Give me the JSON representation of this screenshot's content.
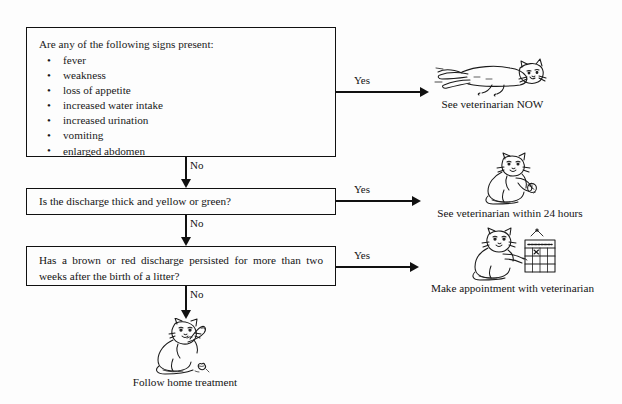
{
  "flowchart": {
    "title": "Vaginal discharge decision chart",
    "background": "#fdfdfd",
    "line_color": "#111111",
    "nodes": [
      {
        "id": "signs",
        "type": "decision",
        "prompt": "Are any of the following signs present:",
        "items": [
          "fever",
          "weakness",
          "loss of appetite",
          "increased water intake",
          "increased urination",
          "vomiting",
          "enlarged abdomen"
        ]
      },
      {
        "id": "discharge",
        "type": "decision",
        "text": "Is the discharge thick and yellow or green?"
      },
      {
        "id": "persist",
        "type": "decision",
        "text": "Has a brown or red discharge persisted for more than two weeks after the birth of a litter?"
      }
    ],
    "edges": [
      {
        "id": "signs-yes",
        "label": "Yes",
        "from": "signs",
        "to": "vet-now"
      },
      {
        "id": "signs-no",
        "label": "No",
        "from": "signs",
        "to": "discharge"
      },
      {
        "id": "discharge-yes",
        "label": "Yes",
        "from": "discharge",
        "to": "vet-24h"
      },
      {
        "id": "discharge-no",
        "label": "No",
        "from": "discharge",
        "to": "persist"
      },
      {
        "id": "persist-yes",
        "label": "Yes",
        "from": "persist",
        "to": "appointment"
      },
      {
        "id": "persist-no",
        "label": "No",
        "from": "persist",
        "to": "home-treatment"
      }
    ],
    "outcomes": [
      {
        "id": "vet-now",
        "caption": "See veterinarian NOW",
        "icon": "running-cat-icon"
      },
      {
        "id": "vet-24h",
        "caption": "See veterinarian within 24 hours",
        "icon": "cat-with-watch-icon"
      },
      {
        "id": "appointment",
        "caption": "Make appointment with veterinarian",
        "icon": "cat-with-calendar-icon"
      },
      {
        "id": "home-treatment",
        "caption": "Follow home treatment",
        "icon": "grooming-cat-icon"
      }
    ]
  }
}
